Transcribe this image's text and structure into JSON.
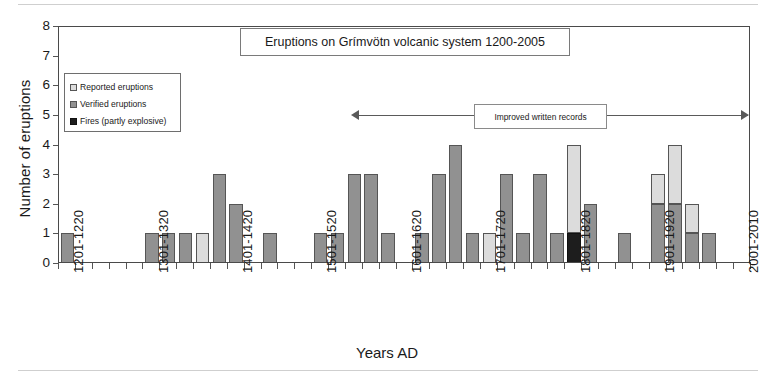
{
  "chart_data": {
    "type": "bar",
    "title": "Eruptions on Grímvötn volcanic system 1200-2005",
    "xlabel": "Years AD",
    "ylabel": "Number of eruptions",
    "ylim": [
      0,
      8
    ],
    "yticks": [
      0,
      1,
      2,
      3,
      4,
      5,
      6,
      7,
      8
    ],
    "grid": false,
    "stacked": true,
    "legend_position": "inside-top-left",
    "bin_width_years": 20,
    "categories": [
      "1201-1220",
      "1221-1240",
      "1241-1260",
      "1261-1280",
      "1281-1300",
      "1301-1320",
      "1321-1340",
      "1341-1360",
      "1361-1380",
      "1381-1400",
      "1401-1420",
      "1421-1440",
      "1441-1460",
      "1461-1480",
      "1481-1500",
      "1501-1520",
      "1521-1540",
      "1541-1560",
      "1561-1580",
      "1581-1600",
      "1601-1620",
      "1621-1640",
      "1641-1660",
      "1661-1680",
      "1681-1700",
      "1701-1720",
      "1721-1740",
      "1741-1760",
      "1761-1780",
      "1781-1800",
      "1801-1820",
      "1821-1840",
      "1841-1860",
      "1861-1880",
      "1881-1900",
      "1901-1920",
      "1921-1940",
      "1941-1960",
      "1961-1980",
      "1981-2000",
      "2001-2010"
    ],
    "xtick_labels": [
      "1201-1220",
      "1301-1320",
      "1401-1420",
      "1501-1520",
      "1601-1620",
      "1701-1720",
      "1801-1820",
      "1901-1920",
      "2001-2010"
    ],
    "xtick_indices": [
      0,
      5,
      10,
      15,
      20,
      25,
      30,
      35,
      40
    ],
    "series": [
      {
        "name": "Verified eruptions",
        "color": "#919191",
        "values": [
          1,
          0,
          0,
          0,
          0,
          1,
          1,
          1,
          0,
          3,
          2,
          0,
          1,
          0,
          0,
          1,
          1,
          3,
          3,
          1,
          0,
          1,
          3,
          4,
          1,
          0,
          3,
          1,
          3,
          1,
          0,
          2,
          0,
          1,
          0,
          2,
          2,
          1,
          1,
          0,
          0
        ]
      },
      {
        "name": "Reported eruptions",
        "color": "#dcdcdc",
        "values": [
          0,
          0,
          0,
          0,
          0,
          0,
          0,
          0,
          1,
          0,
          0,
          0,
          0,
          0,
          0,
          0,
          0,
          0,
          0,
          0,
          0,
          0,
          0,
          0,
          0,
          1,
          0,
          0,
          0,
          0,
          3,
          0,
          0,
          0,
          0,
          1,
          2,
          1,
          0,
          0,
          0
        ]
      },
      {
        "name": "Fires (partly explosive)",
        "color": "#1d1d1d",
        "values": [
          0,
          0,
          0,
          0,
          0,
          0,
          0,
          0,
          0,
          0,
          0,
          0,
          0,
          0,
          0,
          0,
          0,
          0,
          0,
          0,
          0,
          0,
          0,
          0,
          0,
          0,
          0,
          0,
          0,
          0,
          1,
          0,
          0,
          0,
          0,
          0,
          0,
          0,
          0,
          0,
          0
        ]
      }
    ],
    "totals": [
      1,
      0,
      0,
      0,
      0,
      1,
      1,
      1,
      1,
      3,
      2,
      0,
      1,
      0,
      0,
      1,
      1,
      3,
      3,
      1,
      0,
      1,
      3,
      4,
      1,
      1,
      3,
      1,
      3,
      1,
      4,
      2,
      0,
      1,
      0,
      3,
      4,
      2,
      1,
      0,
      0
    ],
    "second_group": {
      "note": "right-hand cluster values read from plot",
      "categories": [
        "1801-1820",
        "1821-1840",
        "1841-1860",
        "1861-1880",
        "1881-1900",
        "1901-1920",
        "1921-1940",
        "1941-1960",
        "1961-1980",
        "1981-2000",
        "2001-2010"
      ],
      "verified": [
        1,
        0,
        2,
        0,
        1,
        2,
        2,
        1,
        1,
        0,
        1
      ],
      "reported": [
        3,
        0,
        0,
        0,
        0,
        1,
        2,
        1,
        0,
        0,
        0
      ],
      "fires": [
        1,
        0,
        0,
        0,
        0,
        0,
        0,
        0,
        0,
        0,
        0
      ]
    },
    "annotation": {
      "text": "Improved written records",
      "arrow": "double-headed",
      "spans_from": "1601-1620",
      "spans_to": "2001-2010"
    },
    "legend_entries": [
      "Reported eruptions",
      "Verified eruptions",
      "Fires (partly explosive)"
    ]
  },
  "colors": {
    "verified": "#919191",
    "reported": "#dcdcdc",
    "fires": "#1d1d1d",
    "axis": "#4a4a4a",
    "background": "#ffffff"
  }
}
